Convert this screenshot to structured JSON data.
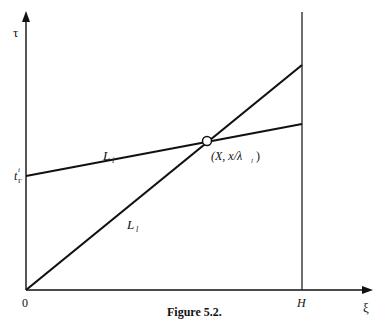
{
  "figure": {
    "caption": "Figure 5.2.",
    "axes": {
      "y_label": "τ",
      "x_label": "ξ",
      "origin_label": "0",
      "x_mark_label": "H",
      "y_mark_label_main": "t",
      "y_mark_label_sup": "i",
      "y_mark_label_sub": "Γ"
    },
    "lines": [
      {
        "name": "L_i shallow",
        "label_main": "L",
        "label_sub": "i"
      },
      {
        "name": "L_l steep",
        "label_main": "L",
        "label_sub": "l"
      }
    ],
    "intersection": {
      "label": "(X, x/λ",
      "label_sub": "l",
      "label_close": ")"
    }
  },
  "colors": {
    "ink": "#111111",
    "background": "#ffffff"
  }
}
